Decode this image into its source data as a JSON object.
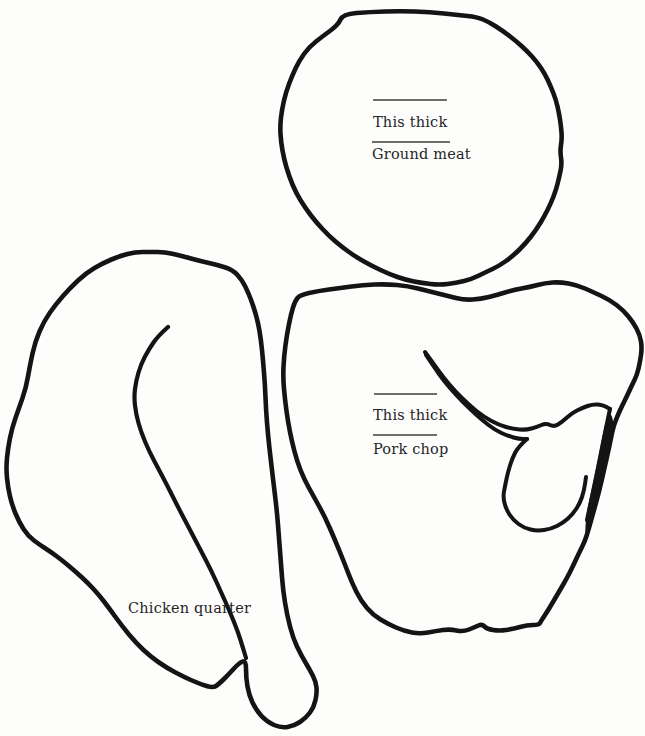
{
  "colors": {
    "ink": "#141414",
    "text": "#262626",
    "rule": "#3c3c3c",
    "background": "#fdfdfc"
  },
  "figure": {
    "ground_meat": {
      "measure_label": "This thick",
      "name_label": "Ground meat"
    },
    "pork_chop": {
      "measure_label": "This thick",
      "name_label": "Pork chop"
    },
    "chicken_quarter": {
      "name_label": "Chicken quarter"
    }
  }
}
